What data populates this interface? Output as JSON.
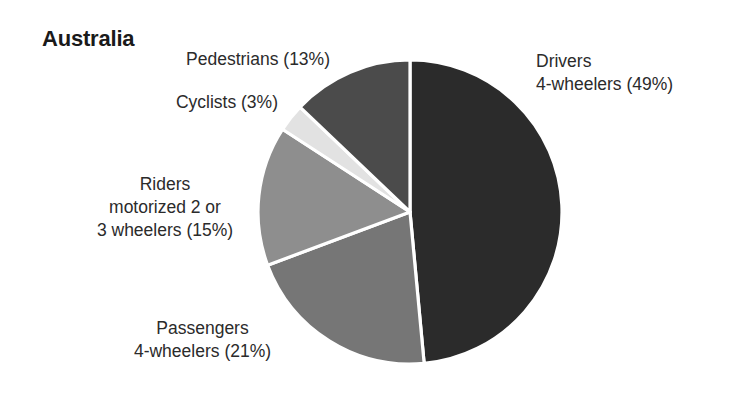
{
  "chart_data": {
    "type": "pie",
    "title": "Australia",
    "xlabel": "",
    "ylabel": "",
    "units": "percent",
    "legend_position": "none",
    "grid": false,
    "start_angle_deg": 0,
    "direction": "clockwise",
    "categories": [
      "Drivers 4-wheelers",
      "Passengers 4-wheelers",
      "Riders motorized 2 or 3 wheelers",
      "Cyclists",
      "Pedestrians"
    ],
    "values": [
      49,
      21,
      15,
      3,
      13
    ],
    "slices": [
      {
        "key": "drivers",
        "name": "Drivers 4-wheelers",
        "value": 49,
        "percent_text": "(49%)",
        "color": "#2b2b2b",
        "label_lines": [
          "Drivers",
          "4-wheelers (49%)"
        ],
        "label_align": "left"
      },
      {
        "key": "passengers",
        "name": "Passengers 4-wheelers",
        "value": 21,
        "percent_text": "(21%)",
        "color": "#767676",
        "label_lines": [
          "Passengers",
          "4-wheelers (21%)"
        ],
        "label_align": "center"
      },
      {
        "key": "riders",
        "name": "Riders motorized 2 or 3 wheelers",
        "value": 15,
        "percent_text": "(15%)",
        "color": "#8e8e8e",
        "label_lines": [
          "Riders",
          "motorized 2 or",
          "3 wheelers (15%)"
        ],
        "label_align": "center"
      },
      {
        "key": "cyclists",
        "name": "Cyclists",
        "value": 3,
        "percent_text": "(3%)",
        "color": "#e2e2e2",
        "label_lines": [
          "Cyclists (3%)"
        ],
        "label_align": "right"
      },
      {
        "key": "pedestrians",
        "name": "Pedestrians",
        "value": 13,
        "percent_text": "(13%)",
        "color": "#4b4b4b",
        "label_lines": [
          "Pedestrians (13%)"
        ],
        "label_align": "right"
      }
    ],
    "separator_color": "#ffffff",
    "background_color": "#ffffff"
  },
  "labels": {
    "drivers": {
      "line1": "Drivers",
      "line2": "4-wheelers (49%)"
    },
    "passengers": {
      "line1": "Passengers",
      "line2": "4-wheelers (21%)"
    },
    "riders": {
      "line1": "Riders",
      "line2": "motorized 2 or",
      "line3": "3 wheelers (15%)"
    },
    "cyclists": {
      "line1": "Cyclists (3%)"
    },
    "pedestrians": {
      "line1": "Pedestrians (13%)"
    }
  },
  "title": "Australia"
}
